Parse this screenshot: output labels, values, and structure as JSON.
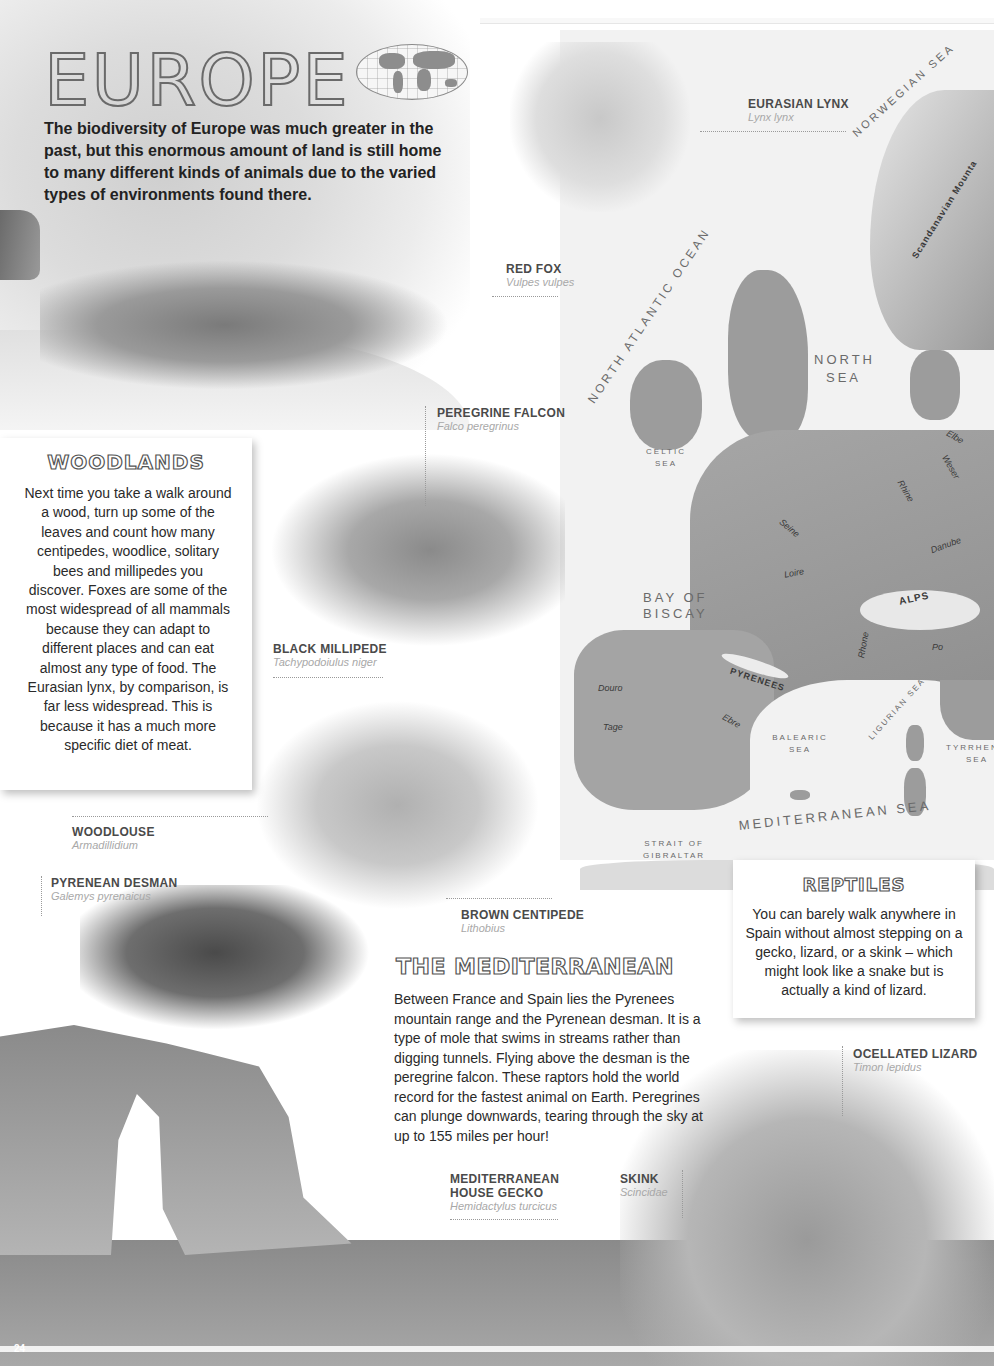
{
  "page": {
    "title": "EUROPE",
    "intro": "The biodiversity of Europe was much greater in the past, but this enormous amount of land is still home to many different kinds of animals due to the varied types of environments found there.",
    "page_number": "24",
    "globe_icon": "world-map-icon"
  },
  "species": {
    "lynx": {
      "name": "EURASIAN LYNX",
      "latin": "Lynx lynx"
    },
    "fox": {
      "name": "RED FOX",
      "latin": "Vulpes vulpes"
    },
    "falcon": {
      "name": "PEREGRINE FALCON",
      "latin": "Falco peregrinus"
    },
    "millipede": {
      "name": "BLACK MILLIPEDE",
      "latin": "Tachypodoiulus niger"
    },
    "woodlouse": {
      "name": "WOODLOUSE",
      "latin": "Armadillidium"
    },
    "desman": {
      "name": "PYRENEAN DESMAN",
      "latin": "Galemys pyrenaicus"
    },
    "centipede": {
      "name": "BROWN CENTIPEDE",
      "latin": "Lithobius"
    },
    "lizard": {
      "name": "OCELLATED LIZARD",
      "latin": "Timon lepidus"
    },
    "gecko": {
      "name_line1": "MEDITERRANEAN",
      "name_line2": "HOUSE GECKO",
      "latin": "Hemidactylus turcicus"
    },
    "skink": {
      "name": "SKINK",
      "latin": "Scincidae"
    }
  },
  "woodlands": {
    "title": "WOODLANDS",
    "body": "Next time you take a walk around a wood, turn up some of the leaves and count how many centipedes, woodlice, solitary bees and millipedes you discover. Foxes are some of the most widespread of all mammals because they can adapt to different places and can eat almost any type of food. The Eurasian lynx, by comparison, is far less widespread. This is because it has a much more specific diet of meat."
  },
  "reptiles": {
    "title": "REPTILES",
    "body": "You can barely walk anywhere in Spain without almost stepping on a gecko, lizard, or a skink – which might look like a snake but is actually a kind of lizard."
  },
  "mediterranean": {
    "title": "THE MEDITERRANEAN",
    "body": "Between France and Spain lies the Pyrenees mountain range and the Pyrenean desman. It is a type of mole that swims in streams rather than digging tunnels. Flying above the desman is the peregrine falcon. These raptors hold the world record for the fastest animal on Earth. Peregrines can plunge downwards, tearing through the sky at up to 155 miles per hour!"
  },
  "map": {
    "seas": {
      "norwegian": "Norwegian Sea",
      "north_atlantic": "North Atlantic Ocean",
      "north_sea_1": "North",
      "north_sea_2": "Sea",
      "celtic_1": "Celtic",
      "celtic_2": "Sea",
      "biscay_1": "Bay of",
      "biscay_2": "Biscay",
      "balearic_1": "Balearic",
      "balearic_2": "Sea",
      "ligurian": "Ligurian Sea",
      "tyrrhenian_1": "Tyrrhen",
      "tyrrhenian_2": "Sea",
      "mediterranean": "Mediterranean Sea",
      "gibraltar_1": "Strait of",
      "gibraltar_2": "Gibraltar"
    },
    "mountains": {
      "scandinavian": "Scandanavian Mounta",
      "alps": "ALPS",
      "pyrenees": "PYRENEES"
    },
    "rivers": {
      "elbe": "Elbe",
      "weser": "Weser",
      "rhine": "Rhine",
      "seine": "Seine",
      "loire": "Loire",
      "danube": "Danube",
      "rhone": "Rhone",
      "po": "Po",
      "douro": "Douro",
      "tage": "Tage",
      "ebre": "Ebre"
    }
  }
}
